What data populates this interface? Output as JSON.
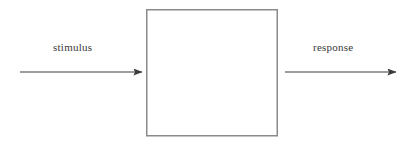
{
  "diagram": {
    "type": "black-box-model",
    "canvas": {
      "width": 411,
      "height": 144,
      "background": "#ffffff"
    },
    "box": {
      "label": "",
      "x": 146,
      "y": 9,
      "width": 131,
      "height": 127,
      "stroke_color": "#8a8a8a",
      "stroke_width": 1.5,
      "fill": "none"
    },
    "arrows": [
      {
        "name": "input-arrow",
        "label": "stimulus",
        "direction": "right",
        "x1": 20,
        "x2": 143,
        "y": 72,
        "color": "#3c3c3c",
        "stroke_width": 1.2
      },
      {
        "name": "output-arrow",
        "label": "response",
        "direction": "right",
        "x1": 285,
        "x2": 397,
        "y": 72,
        "color": "#3c3c3c",
        "stroke_width": 1.2
      }
    ],
    "labels": {
      "input": "stimulus",
      "output": "response",
      "color": "#3a3a3a"
    }
  }
}
